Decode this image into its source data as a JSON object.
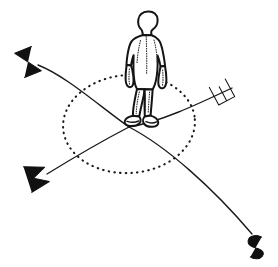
{
  "illustration": {
    "title": "Person standing at centre of compass directions",
    "kind": "hand-drawn line diagram",
    "ink_color": "#141414",
    "background_color": "#ffffff",
    "figure": {
      "name": "human figure",
      "pose": "standing upright, arms at sides, feet together at origin"
    },
    "horizon": {
      "name": "horizon circle",
      "style": "dotted ellipse",
      "center": [
        129,
        124
      ],
      "radius_x": 66,
      "radius_y": 49
    },
    "labels": [
      {
        "id": "north",
        "text": "N",
        "position": [
          28,
          62
        ],
        "rotation": -112
      },
      {
        "id": "east",
        "text": "E",
        "position": [
          222,
          92
        ],
        "rotation": -118
      },
      {
        "id": "west",
        "text": "W",
        "position": [
          37,
          176
        ],
        "rotation": -108
      },
      {
        "id": "south",
        "text": "S",
        "position": [
          254,
          247
        ],
        "rotation": -100
      }
    ],
    "axes": [
      {
        "id": "north-east-axis",
        "from": "N",
        "to": "E",
        "through": "origin"
      },
      {
        "id": "west-south-axis",
        "from": "W",
        "to": "S",
        "through": "origin"
      }
    ],
    "origin": {
      "name": "origin",
      "position": [
        129,
        127
      ]
    }
  }
}
